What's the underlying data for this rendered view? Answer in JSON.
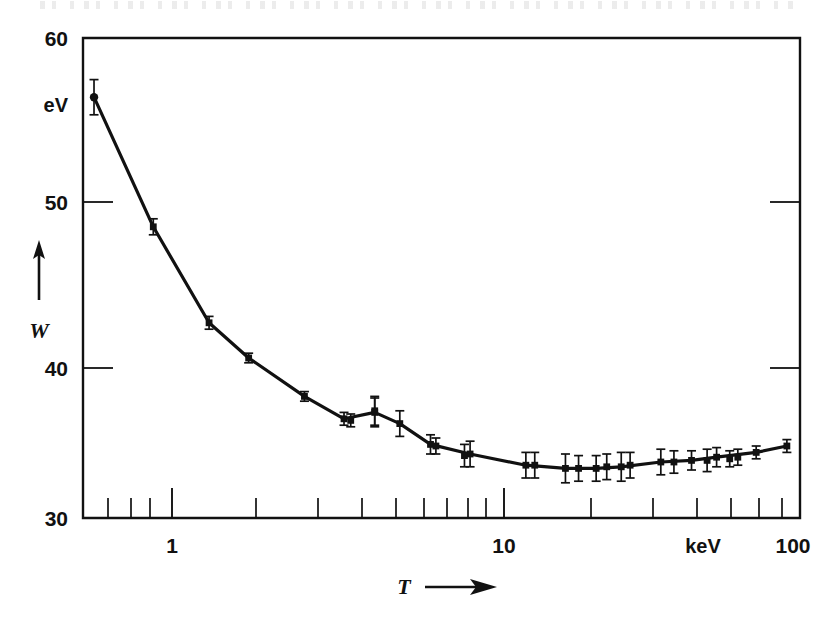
{
  "figure": {
    "y_unit_label": "eV",
    "y_axis_symbol": "W",
    "x_axis_symbol": "T",
    "x_unit_label": "keV",
    "arrow_glyph": "→"
  },
  "chart_data": {
    "type": "line",
    "title": "",
    "subtitle": "",
    "xlabel": "T",
    "ylabel": "W",
    "x_unit": "keV",
    "y_unit": "eV",
    "xscale": "log",
    "yscale": "linear",
    "xlim": [
      0.6,
      110
    ],
    "ylim": [
      30,
      60
    ],
    "grid": false,
    "legend": "none",
    "y_ticks": [
      30,
      40,
      50,
      60
    ],
    "y_tick_labels": [
      "30",
      "40",
      "50",
      "60"
    ],
    "x_ticks": [
      1,
      10,
      100
    ],
    "x_tick_labels": [
      "1",
      "10",
      "100"
    ],
    "x_minor_ticks": [
      0.7,
      0.8,
      0.9,
      2,
      3,
      4,
      5,
      6,
      7,
      8,
      9,
      20,
      30,
      40,
      50,
      60,
      70,
      80,
      90
    ],
    "series": [
      {
        "name": "W",
        "x": [
          0.65,
          1.0,
          1.5,
          2.0,
          3.0,
          4.0,
          5.0,
          6.0,
          7.5,
          10.0,
          15.0,
          20.0,
          25.0,
          30.0,
          40.0,
          50.0,
          60.0,
          80.0,
          100.0
        ],
        "values": [
          56.3,
          48.2,
          42.2,
          40.0,
          37.6,
          36.2,
          36.6,
          35.9,
          34.6,
          34.0,
          33.3,
          33.1,
          33.1,
          33.2,
          33.5,
          33.6,
          33.8,
          34.1,
          34.5
        ],
        "errors": [
          1.1,
          0.5,
          0.4,
          0.3,
          0.3,
          0.4,
          0.9,
          0.8,
          0.6,
          0.8,
          0.8,
          0.9,
          0.8,
          0.9,
          0.8,
          0.6,
          0.6,
          0.4,
          0.4
        ]
      }
    ],
    "extra_points": {
      "x": [
        4.2,
        5.0,
        7.8,
        9.6,
        16.0,
        22.0,
        27.0,
        32.0,
        44.0,
        56.0,
        66.0,
        70.0
      ],
      "values": [
        36.1,
        36.7,
        34.5,
        33.9,
        33.3,
        33.1,
        33.2,
        33.3,
        33.5,
        33.6,
        33.7,
        33.8
      ],
      "errors": [
        0.4,
        0.9,
        0.5,
        0.7,
        0.8,
        0.8,
        0.8,
        0.8,
        0.7,
        0.7,
        0.5,
        0.5
      ]
    },
    "annotations": [
      {
        "text": "eV",
        "role": "y-unit"
      },
      {
        "text": "keV",
        "role": "x-unit"
      },
      {
        "text": "W",
        "role": "y-symbol"
      },
      {
        "text": "T",
        "role": "x-symbol"
      }
    ]
  }
}
